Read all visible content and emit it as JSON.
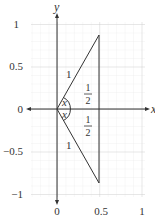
{
  "diagram": {
    "axes": {
      "x_label": "x",
      "y_label": "y",
      "x_ticks": [
        {
          "value": 0,
          "label": "0"
        },
        {
          "value": 0.5,
          "label": "0.5"
        },
        {
          "value": 1,
          "label": "1"
        }
      ],
      "y_ticks": [
        {
          "value": 1,
          "label": "1"
        },
        {
          "value": 0.5,
          "label": "0.5"
        },
        {
          "value": 0,
          "label": "0"
        },
        {
          "value": -0.5,
          "label": "−0.5"
        },
        {
          "value": -1,
          "label": "−1"
        }
      ]
    },
    "triangle": {
      "vertices": [
        [
          0,
          0
        ],
        [
          0.5,
          0.866
        ],
        [
          0.5,
          -0.866
        ]
      ],
      "upper_hypotenuse_label": "1",
      "lower_hypotenuse_label": "1",
      "upper_half_numerator": "1",
      "upper_half_denominator": "2",
      "lower_half_numerator": "1",
      "lower_half_denominator": "2",
      "upper_angle_label": "x",
      "lower_angle_label": "x"
    },
    "colors": {
      "grid_minor": "#e6e6e6",
      "grid_major": "#cfcfcf",
      "axis": "#333333",
      "triangle": "#333333",
      "text": "#333333"
    }
  }
}
